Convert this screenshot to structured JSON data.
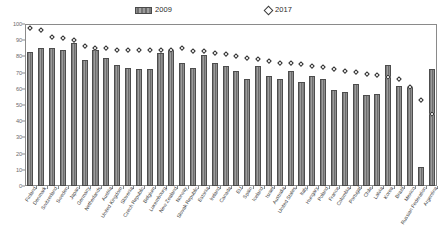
{
  "legend": {
    "bars_label": "2009",
    "points_label": "2017",
    "bar_swatch_icon": "bar-swatch-icon",
    "diamond_swatch_icon": "diamond-marker-icon"
  },
  "axis": {
    "y_ticks": [
      0,
      10,
      20,
      30,
      40,
      50,
      60,
      70,
      80,
      90,
      100
    ]
  },
  "chart_data": {
    "type": "bar",
    "title": "",
    "subtitle": "",
    "xlabel": "",
    "ylabel": "",
    "ylim": [
      0,
      100
    ],
    "grid": false,
    "legend_position": "top",
    "categories": [
      "Finland",
      "Denmark",
      "Switzerland",
      "Sweden",
      "Japan",
      "Germany",
      "Netherlands",
      "Austria",
      "United Kingdom",
      "Slovenia",
      "Czech Republic",
      "Belgium",
      "Luxembourg",
      "New Zealand",
      "Norway",
      "Slovak Republic",
      "Estonia",
      "Ireland",
      "Canada",
      "EU",
      "Spain",
      "Iceland",
      "Israel",
      "Australia",
      "United States",
      "Italy",
      "Hungary",
      "Poland",
      "France",
      "Colombia",
      "Portugal",
      "Chile",
      "Latvia",
      "Korea",
      "Brazil",
      "Mexico",
      "Russian Federation",
      "Argentina"
    ],
    "series": [
      {
        "name": "2009",
        "type": "bar",
        "values": [
          83,
          85,
          85,
          84,
          88,
          78,
          84,
          79,
          75,
          73,
          72,
          72,
          82,
          84,
          76,
          73,
          81,
          76,
          74,
          71,
          66,
          74,
          68,
          66,
          71,
          64,
          68,
          66,
          59,
          58,
          63,
          56,
          57,
          75,
          62,
          61,
          12,
          72
        ]
      },
      {
        "name": "2017",
        "type": "scatter",
        "values": [
          97,
          96,
          92,
          91,
          90,
          86,
          85,
          85,
          84,
          84,
          84,
          84,
          84,
          84,
          85,
          83,
          83,
          82,
          81,
          80,
          79,
          78,
          77,
          76,
          76,
          75,
          74,
          73,
          72,
          71,
          70,
          69,
          68,
          67,
          66,
          61,
          53,
          44
        ]
      }
    ]
  }
}
